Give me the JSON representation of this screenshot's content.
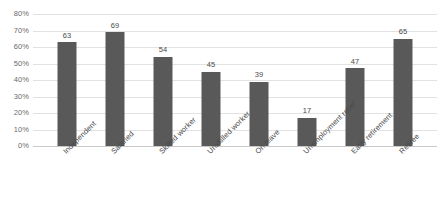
{
  "chart_data": {
    "type": "bar",
    "title": "",
    "subtitle": "",
    "xlabel": "",
    "ylabel": "",
    "categories": [
      "Independent",
      "Salaried",
      "Skilled worker",
      "Unskilled worker",
      "On leave",
      "Unemployment relief",
      "Early retirement",
      "Retiree"
    ],
    "values": [
      63,
      69,
      54,
      45,
      39,
      17,
      47,
      65
    ],
    "data_labels": [
      "63",
      "69",
      "54",
      "45",
      "39",
      "17",
      "47",
      "65"
    ],
    "ylim": [
      0,
      80
    ],
    "ytick_values": [
      0,
      10,
      20,
      30,
      40,
      50,
      60,
      70,
      80
    ],
    "ytick_labels": [
      "0%",
      "10%",
      "20%",
      "30%",
      "40%",
      "50%",
      "60%",
      "70%",
      "80%"
    ],
    "grid": true,
    "legend": "none",
    "legend_position": "none",
    "series": [
      {
        "name": "",
        "values": [
          63,
          69,
          54,
          45,
          39,
          17,
          47,
          65
        ],
        "color": "#595959"
      }
    ],
    "colors": {
      "bar": "#595959",
      "gridline": "#e2e2e2",
      "axis": "#c9c9c9",
      "tick_text": "#6b6b6b",
      "label_text": "#4a4a4a",
      "background": "#ffffff"
    },
    "category_label_rotation": -45
  }
}
